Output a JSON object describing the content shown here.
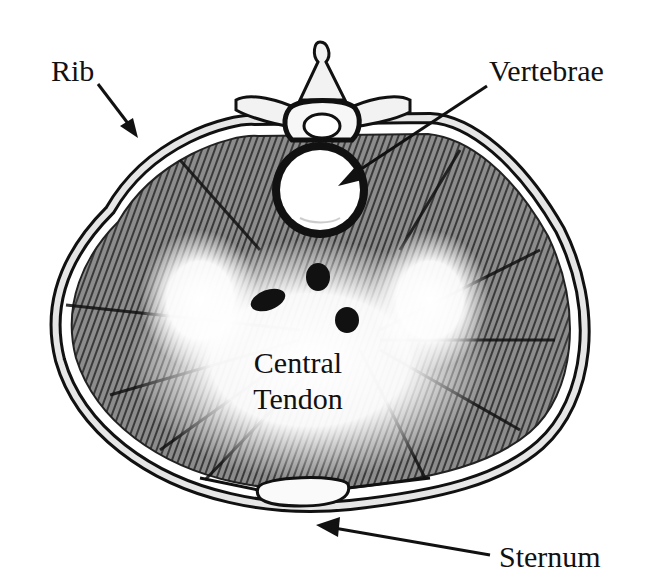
{
  "figure": {
    "labels": {
      "rib": "Rib",
      "vertebrae": "Vertebrae",
      "central_tendon_line1": "Central",
      "central_tendon_line2": "Tendon",
      "sternum": "Sternum"
    },
    "colors": {
      "background": "#ffffff",
      "ink": "#111111",
      "muscle_dark": "#2a2a2a",
      "muscle_mid": "#7a7a7a",
      "tendon": "#ffffff"
    }
  }
}
